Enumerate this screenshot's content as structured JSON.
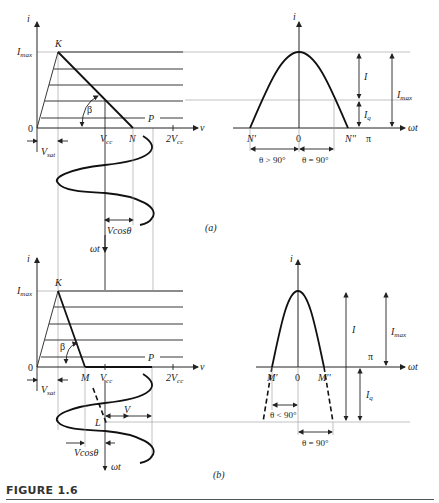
{
  "figure": {
    "caption": "FIGURE 1.6",
    "panels": [
      {
        "id": "a",
        "label": "(a)",
        "left_plot": {
          "y_axis": "i",
          "x_axis": "v",
          "origin": "0",
          "y_label_max": "I",
          "y_label_max_sub": "max",
          "point_K": "K",
          "point_N": "N",
          "point_P": "P",
          "angle": "β",
          "tick_vcc": "V",
          "tick_vcc_sub": "cc",
          "tick_2vcc": "2V",
          "tick_2vcc_sub": "cc",
          "vsat": "V",
          "vsat_sub": "sat",
          "vcos": "Vcosθ",
          "time_axis": "ωt"
        },
        "right_plot": {
          "y_axis": "i",
          "x_axis": "ωt",
          "origin": "0",
          "left_zero": "N'",
          "right_zero": "N''",
          "pi": "π",
          "I": "I",
          "Iq": "I",
          "Iq_sub": "q",
          "Imax": "I",
          "Imax_sub": "max",
          "theta_left": "θ > 90°",
          "theta_right": "θ = 90°"
        }
      },
      {
        "id": "b",
        "label": "(b)",
        "left_plot": {
          "y_axis": "i",
          "x_axis": "v",
          "origin": "0",
          "y_label_max": "I",
          "y_label_max_sub": "max",
          "point_K": "K",
          "point_M": "M",
          "point_P": "P",
          "point_L": "L",
          "angle": "β",
          "tick_vcc": "V",
          "tick_vcc_sub": "cc",
          "tick_2vcc": "2V",
          "tick_2vcc_sub": "cc",
          "vsat": "V",
          "vsat_sub": "sat",
          "V": "V",
          "vcos": "Vcosθ",
          "time_axis": "ωt"
        },
        "right_plot": {
          "y_axis": "i",
          "x_axis": "ωt",
          "origin": "0",
          "left_zero": "M'",
          "right_zero": "M''",
          "pi": "π",
          "I": "I",
          "Iq": "I",
          "Iq_sub": "q",
          "Imax": "I",
          "Imax_sub": "max",
          "theta_left": "θ < 90°",
          "theta_right": "θ = 90°"
        }
      }
    ]
  }
}
